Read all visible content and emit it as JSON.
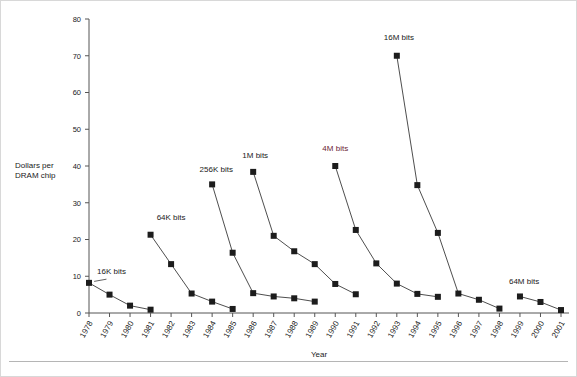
{
  "figure": {
    "background": "#ffffff",
    "marker_color": "#1c1c1c",
    "line_color": "#3a3a3a",
    "axis_color": "#555555",
    "accent_color": "#6b2534"
  },
  "chart_data": {
    "type": "line",
    "title": "",
    "xlabel": "Year",
    "ylabel": "Dollars per DRAM chip",
    "ylabel_line1": "Dollars per",
    "ylabel_line2": "DRAM chip",
    "grid": false,
    "legend_position": "inline-annotations",
    "ylim": [
      0,
      80
    ],
    "yticks": [
      0,
      10,
      20,
      30,
      40,
      50,
      60,
      70,
      80
    ],
    "ytick_labels": [
      "0",
      "10",
      "20",
      "30",
      "40",
      "50",
      "60",
      "70",
      "80"
    ],
    "x": [
      1978,
      1979,
      1980,
      1981,
      1982,
      1983,
      1984,
      1985,
      1986,
      1987,
      1988,
      1989,
      1990,
      1991,
      1992,
      1993,
      1994,
      1995,
      1996,
      1997,
      1998,
      1999,
      2000,
      2001
    ],
    "xtick_labels": [
      "1978",
      "1979",
      "1980",
      "1981",
      "1982",
      "1983",
      "1984",
      "1985",
      "1986",
      "1987",
      "1988",
      "1989",
      "1990",
      "1991",
      "1992",
      "1993",
      "1994",
      "1995",
      "1996",
      "1997",
      "1998",
      "1999",
      "2000",
      "2001"
    ],
    "series": [
      {
        "name": "16K bits",
        "label": "16K bits",
        "label_accent": false,
        "x": [
          1978,
          1979,
          1980,
          1981
        ],
        "values": [
          8.2,
          5.0,
          2.0,
          0.9
        ]
      },
      {
        "name": "64K bits",
        "label": "64K bits",
        "label_accent": false,
        "x": [
          1981,
          1982,
          1983,
          1984,
          1985
        ],
        "values": [
          21.3,
          13.3,
          5.3,
          3.1,
          1.1
        ]
      },
      {
        "name": "256K bits",
        "label": "256K bits",
        "label_accent": false,
        "x": [
          1984,
          1985,
          1986,
          1987,
          1988,
          1989
        ],
        "values": [
          35.0,
          16.4,
          5.4,
          4.5,
          4.0,
          3.1
        ]
      },
      {
        "name": "1M bits",
        "label": "1M bits",
        "label_accent": false,
        "x": [
          1986,
          1987,
          1988,
          1989,
          1990,
          1991
        ],
        "values": [
          38.4,
          21.0,
          16.8,
          13.3,
          7.9,
          5.1
        ]
      },
      {
        "name": "4M bits",
        "label": "4M bits",
        "label_accent": true,
        "x": [
          1990,
          1991,
          1992,
          1993,
          1994,
          1995
        ],
        "values": [
          40.0,
          22.6,
          13.5,
          8.0,
          5.2,
          4.4
        ]
      },
      {
        "name": "16M bits",
        "label": "16M bits",
        "label_accent": false,
        "x": [
          1993,
          1994,
          1995,
          1996,
          1997,
          1998
        ],
        "values": [
          70.0,
          34.8,
          21.8,
          5.3,
          3.6,
          1.2
        ]
      },
      {
        "name": "64M bits",
        "label": "64M bits",
        "label_accent": false,
        "x": [
          1999,
          2000,
          2001
        ],
        "values": [
          4.5,
          3.0,
          0.8
        ]
      }
    ],
    "annotations": [
      {
        "text": "16K bits",
        "x": 1979.1,
        "y": 10.6,
        "accent": false
      },
      {
        "text": "64K bits",
        "x": 1982.0,
        "y": 25.2,
        "accent": false
      },
      {
        "text": "256K bits",
        "x": 1984.2,
        "y": 38.4,
        "accent": false
      },
      {
        "text": "1M bits",
        "x": 1986.1,
        "y": 42.2,
        "accent": false
      },
      {
        "text": "4M bits",
        "x": 1990.0,
        "y": 44.2,
        "accent": true
      },
      {
        "text": "16M bits",
        "x": 1993.1,
        "y": 74.2,
        "accent": false
      },
      {
        "text": "64M bits",
        "x": 1999.2,
        "y": 8.0,
        "accent": false
      }
    ]
  }
}
